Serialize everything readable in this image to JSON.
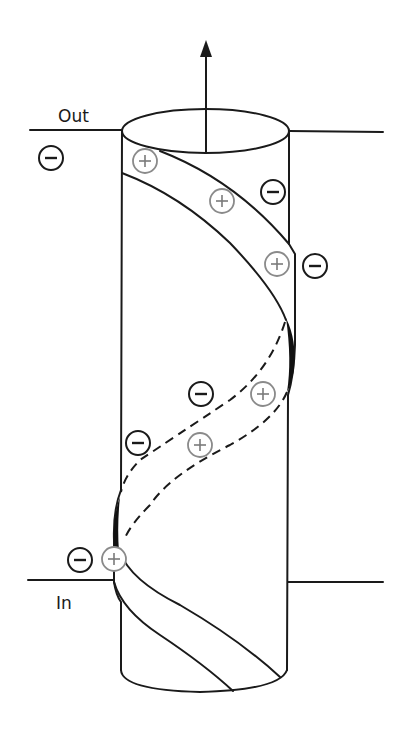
{
  "diagram": {
    "labels": {
      "out": "Out",
      "in": "In"
    },
    "arrow": {
      "direction": "up",
      "meaning": "dipole / axis direction"
    },
    "colors": {
      "line": "#1a1a1a",
      "positive_charge": "#8a8a8a",
      "negative_charge": "#1a1a1a",
      "background": "#ffffff"
    },
    "charges": [
      {
        "sign": "negative",
        "x": 51,
        "y": 158
      },
      {
        "sign": "positive",
        "x": 145,
        "y": 161
      },
      {
        "sign": "positive",
        "x": 222,
        "y": 201
      },
      {
        "sign": "negative",
        "x": 273,
        "y": 192
      },
      {
        "sign": "positive",
        "x": 277,
        "y": 264
      },
      {
        "sign": "negative",
        "x": 315,
        "y": 266
      },
      {
        "sign": "negative",
        "x": 201,
        "y": 394
      },
      {
        "sign": "positive",
        "x": 263,
        "y": 394
      },
      {
        "sign": "negative",
        "x": 138,
        "y": 443
      },
      {
        "sign": "positive",
        "x": 200,
        "y": 445
      },
      {
        "sign": "negative",
        "x": 80,
        "y": 560
      },
      {
        "sign": "positive",
        "x": 114,
        "y": 559
      }
    ]
  }
}
